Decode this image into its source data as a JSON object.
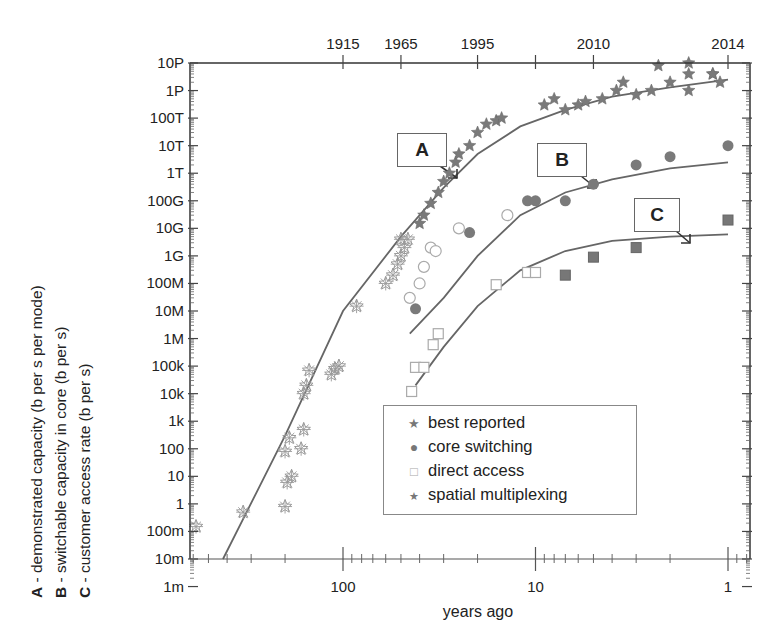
{
  "chart_data": {
    "type": "scatter",
    "title": "",
    "xlabel": "years ago",
    "xscale": "log (reversed)",
    "xlim": [
      620,
      0.8
    ],
    "x_ticks": [
      {
        "label": "100",
        "value": 100
      },
      {
        "label": "10",
        "value": 10
      },
      {
        "label": "1",
        "value": 1
      }
    ],
    "top_axis": {
      "label": "year",
      "ticks": [
        {
          "label": "1915",
          "years_ago": 100
        },
        {
          "label": "1965",
          "years_ago": 50
        },
        {
          "label": "1995",
          "years_ago": 20
        },
        {
          "label": "",
          "years_ago": 10
        },
        {
          "label": "2010",
          "years_ago": 5
        },
        {
          "label": "2014",
          "years_ago": 1
        }
      ]
    },
    "ylabel": [
      "A - demonstrated capacity (b per s per mode)",
      "B - switchable capacity in core (b per s)",
      "C - customer access rate (b per s)"
    ],
    "yscale": "log",
    "ylim": [
      0.001,
      1e+16
    ],
    "y_ticks": [
      "10P",
      "1P",
      "100T",
      "10T",
      "1T",
      "100G",
      "10G",
      "1G",
      "100M",
      "10M",
      "1M",
      "100k",
      "10k",
      "1k",
      "100",
      "10",
      "1",
      "100m",
      "10m",
      "1m"
    ],
    "legend": {
      "position": "lower right inside",
      "entries": [
        "best reported",
        "core switching",
        "direct access",
        "spatial multiplexing"
      ]
    },
    "annotations": [
      {
        "label": "A",
        "points_to_curve": "A - demonstrated capacity",
        "at_years_ago": 24
      },
      {
        "label": "B",
        "points_to_curve": "B - switchable core capacity",
        "at_years_ago": 4.8
      },
      {
        "label": "C",
        "points_to_curve": "C - customer access rate",
        "at_years_ago": 1.5
      }
    ],
    "curves": [
      {
        "name": "A",
        "points": [
          [
            420,
            0.001
          ],
          [
            200,
            30
          ],
          [
            100,
            1000000.0
          ],
          [
            50,
            500000000.0
          ],
          [
            30,
            30000000000.0
          ],
          [
            20,
            500000000000.0
          ],
          [
            12,
            5000000000000.0
          ],
          [
            7,
            20000000000000.0
          ],
          [
            4,
            60000000000000.0
          ],
          [
            2,
            130000000000000.0
          ],
          [
            1,
            250000000000000.0
          ]
        ]
      },
      {
        "name": "B",
        "points": [
          [
            45,
            150000.0
          ],
          [
            30,
            3000000.0
          ],
          [
            20,
            100000000.0
          ],
          [
            12,
            3000000000.0
          ],
          [
            7,
            20000000000.0
          ],
          [
            4,
            60000000000.0
          ],
          [
            2,
            150000000000.0
          ],
          [
            1,
            250000000000.0
          ]
        ]
      },
      {
        "name": "C",
        "points": [
          [
            42,
            2000.0
          ],
          [
            30,
            50000.0
          ],
          [
            20,
            1500000.0
          ],
          [
            12,
            30000000.0
          ],
          [
            7,
            150000000.0
          ],
          [
            4,
            350000000.0
          ],
          [
            2,
            500000000.0
          ],
          [
            1,
            600000000.0
          ]
        ]
      }
    ],
    "series": [
      {
        "name": "best reported (A, open stars/asterisks, early era)",
        "marker": "asterisk-open",
        "points": [
          [
            580,
            0.015
          ],
          [
            330,
            0.05
          ],
          [
            200,
            0.08
          ],
          [
            195,
            0.6
          ],
          [
            185,
            1
          ],
          [
            200,
            8
          ],
          [
            190,
            25
          ],
          [
            160,
            50
          ],
          [
            165,
            10
          ],
          [
            160,
            1000
          ],
          [
            155,
            2000
          ],
          [
            150,
            7000
          ],
          [
            115,
            5000
          ],
          [
            110,
            8000
          ],
          [
            105,
            10000
          ],
          [
            85,
            1500000.0
          ],
          [
            60,
            10000000.0
          ],
          [
            55,
            20000000.0
          ],
          [
            52,
            50000000.0
          ],
          [
            50,
            100000000.0
          ],
          [
            48,
            200000000.0
          ],
          [
            50,
            400000000.0
          ],
          [
            46,
            400000000.0
          ]
        ]
      },
      {
        "name": "best reported",
        "marker": "star-filled",
        "points": [
          [
            40,
            1500000000.0
          ],
          [
            38,
            3000000000.0
          ],
          [
            35,
            8000000000.0
          ],
          [
            32,
            20000000000.0
          ],
          [
            30,
            50000000000.0
          ],
          [
            28,
            100000000000.0
          ],
          [
            26,
            250000000000.0
          ],
          [
            25,
            500000000000.0
          ],
          [
            22,
            1000000000000.0
          ],
          [
            20,
            3000000000000.0
          ],
          [
            18,
            6000000000000.0
          ],
          [
            16,
            8000000000000.0
          ],
          [
            15,
            10000000000000.0
          ],
          [
            9,
            30000000000000.0
          ],
          [
            8,
            50000000000000.0
          ],
          [
            7,
            20000000000000.0
          ],
          [
            6,
            30000000000000.0
          ],
          [
            5.5,
            40000000000000.0
          ],
          [
            4.5,
            50000000000000.0
          ],
          [
            3.8,
            100000000000000.0
          ],
          [
            3.5,
            200000000000000.0
          ],
          [
            3,
            70000000000000.0
          ],
          [
            2.5,
            100000000000000.0
          ],
          [
            2.3,
            800000000000000.0
          ],
          [
            2,
            200000000000000.0
          ],
          [
            1.6,
            400000000000000.0
          ],
          [
            1.6,
            100000000000000.0
          ],
          [
            1.2,
            400000000000000.0
          ],
          [
            1.1,
            200000000000000.0
          ]
        ]
      },
      {
        "name": "core switching",
        "marker": "circle-filled",
        "points": [
          [
            42,
            1200000.0
          ],
          [
            22,
            700000000.0
          ],
          [
            11,
            10000000000.0
          ],
          [
            10,
            10000000000.0
          ],
          [
            7,
            10000000000.0
          ],
          [
            5,
            40000000000.0
          ],
          [
            3,
            200000000000.0
          ],
          [
            2,
            400000000000.0
          ],
          [
            1,
            1000000000000.0
          ]
        ]
      },
      {
        "name": "core switching (historical, open)",
        "marker": "circle-open",
        "points": [
          [
            45,
            3000000.0
          ],
          [
            40,
            10000000.0
          ],
          [
            38,
            40000000.0
          ],
          [
            35,
            200000000.0
          ],
          [
            33,
            150000000.0
          ],
          [
            14,
            3000000000.0
          ],
          [
            25,
            1000000000.0
          ]
        ]
      },
      {
        "name": "direct access",
        "marker": "square-open",
        "points": [
          [
            44,
            1200
          ],
          [
            42,
            9000
          ],
          [
            38,
            9000
          ],
          [
            34,
            60000.0
          ],
          [
            32,
            150000.0
          ],
          [
            16,
            9000000.0
          ],
          [
            11,
            25000000.0
          ],
          [
            10,
            25000000.0
          ]
        ]
      },
      {
        "name": "direct access (filled)",
        "marker": "square-filled",
        "points": [
          [
            7,
            20000000.0
          ],
          [
            5,
            90000000.0
          ],
          [
            3,
            200000000.0
          ],
          [
            1,
            2000000000.0
          ]
        ]
      },
      {
        "name": "spatial multiplexing",
        "marker": "star-filled",
        "points": [
          [
            1.6,
            1000000000000000.0
          ],
          [
            1.2,
            400000000000000.0
          ]
        ]
      }
    ]
  },
  "side_labels": {
    "a_key": "A",
    "a_text": " - demonstrated capacity (b per s per mode)",
    "b_key": "B",
    "b_text": " - switchable capacity in core (b per s)",
    "c_key": "C",
    "c_text": " - customer access rate (b per s)"
  },
  "legend": {
    "items": [
      {
        "symbol": "★",
        "label": "best reported"
      },
      {
        "symbol": "●",
        "label": "core switching"
      },
      {
        "symbol": "□",
        "label": "direct access"
      },
      {
        "symbol": "★",
        "label": "spatial multiplexing"
      }
    ]
  },
  "callouts": {
    "a": "A",
    "b": "B",
    "c": "C"
  },
  "colors": {
    "axis": "#333333",
    "curve": "#666666",
    "marker": "#777777",
    "marker_open": "#999999"
  }
}
